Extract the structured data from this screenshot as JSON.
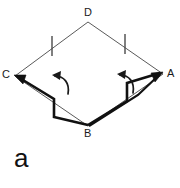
{
  "figure": {
    "panel_label": "a",
    "background_color": "#ffffff",
    "ink_color": "#1a1a1a",
    "thin_stroke_color": "#5a5a5a",
    "width": 180,
    "height": 188
  },
  "vertices": [
    {
      "name": "D",
      "label": "D",
      "x": 88,
      "y": 22
    },
    {
      "name": "A",
      "label": "A",
      "x": 163,
      "y": 74
    },
    {
      "name": "B",
      "label": "B",
      "x": 88,
      "y": 126
    },
    {
      "name": "C",
      "label": "C",
      "x": 15,
      "y": 76
    }
  ],
  "outline": {
    "name": "quadrilateral-ABCD",
    "points": "88,22 163,74 88,126 15,76",
    "stroke_width": 1
  },
  "tick_marks": [
    {
      "name": "tick-CD",
      "x": 52,
      "y1": 36,
      "y2": 56
    },
    {
      "name": "tick-DA",
      "x": 125,
      "y1": 34,
      "y2": 54
    }
  ],
  "folds": [
    {
      "name": "fold-left-C-to-B",
      "path": "M 18,77 L 54,99 L 54,117 L 88,125",
      "stroke_width": 2.6,
      "arrow_at": "C"
    },
    {
      "name": "fold-right-B-to-A",
      "path": "M 88,125 L 127,101 L 127,83 L 160,73",
      "stroke_width": 2.6,
      "arrow_at": "A"
    }
  ],
  "rotation_arrows": [
    {
      "name": "rotation-arrow-left",
      "direction": "counter-clockwise",
      "cx": 58,
      "cy": 85
    },
    {
      "name": "rotation-arrow-right",
      "direction": "counter-clockwise",
      "cx": 120,
      "cy": 84
    }
  ]
}
